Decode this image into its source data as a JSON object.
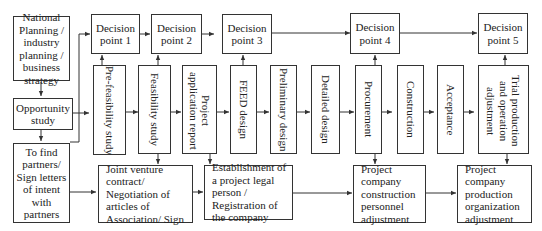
{
  "left_column": {
    "planning": "National Planning / industry planning / business strategy",
    "opportunity": "Opportunity study",
    "partners": "To find partners/ Sign letters of intent with partners"
  },
  "decision_points": [
    {
      "label": "Decision point 1"
    },
    {
      "label": "Decision point 2"
    },
    {
      "label": "Decision point 3"
    },
    {
      "label": "Decision point 4"
    },
    {
      "label": "Decision point 5"
    }
  ],
  "phases": [
    {
      "label": "Pre-feasibility study"
    },
    {
      "label": "Feasibility study"
    },
    {
      "label": "Project application report"
    },
    {
      "label": "FEED design"
    },
    {
      "label": "Preliminary design"
    },
    {
      "label": "Detailed design"
    },
    {
      "label": "Procurement"
    },
    {
      "label": "Construction"
    },
    {
      "label": "Acceptance"
    },
    {
      "label": "Trial production and operation adjustment"
    }
  ],
  "bottom_row": [
    {
      "label": "Joint venture contract/ Negotiation of articles of Association/ Sign"
    },
    {
      "label": "Establishment of a project legal person / Registration of the company"
    },
    {
      "label": "Project company construction personnel adjustment"
    },
    {
      "label": "Project company production organization adjustment"
    }
  ]
}
